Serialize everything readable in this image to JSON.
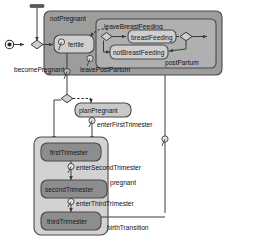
{
  "diagram": {
    "colors": {
      "outer_region_fill": "#9d9d9d",
      "inner_region_fill": "#b0b0b0",
      "pregnant_region_fill": "#d2d2d2",
      "state_fill_light": "#cfcfcf",
      "state_fill_dark": "#8d8d8d",
      "plan_state_fill": "#c9c9c9",
      "stroke": "#4a4a4a",
      "text": "#141414",
      "background": "#ffffff"
    },
    "regions": [
      {
        "id": "notPregnant",
        "label": "notPregnant"
      },
      {
        "id": "postPartum",
        "label": "postPartum"
      },
      {
        "id": "pregnant",
        "label": "pregnant"
      }
    ],
    "states": [
      {
        "id": "fertile",
        "label": "fertile"
      },
      {
        "id": "breastFeeding",
        "label": "breastFeeding"
      },
      {
        "id": "notBreastFeeding",
        "label": "notBreastFeeding"
      },
      {
        "id": "planPregnant",
        "label": "planPregnant"
      },
      {
        "id": "firstTrimester",
        "label": "firstTrimester"
      },
      {
        "id": "secondTrimester",
        "label": "secondTrimester"
      },
      {
        "id": "thirdTrimester",
        "label": "thirdTrimester"
      }
    ],
    "transitions": [
      {
        "id": "becomePregnant",
        "label": "becomePregnant"
      },
      {
        "id": "leaveBreastFeeding",
        "label": "leaveBreastFeeding"
      },
      {
        "id": "leavePostPartum",
        "label": "leavePostPartum"
      },
      {
        "id": "enterFirstTrimester",
        "label": "enterFirstTrimester"
      },
      {
        "id": "enterSecondTrimester",
        "label": "enterSecondTrimester"
      },
      {
        "id": "enterThirdTrimester",
        "label": "enterThirdTrimester"
      },
      {
        "id": "birthTransition",
        "label": "birthTransition"
      }
    ],
    "nodes": [
      {
        "id": "initial-node",
        "kind": "initial-state-icon"
      },
      {
        "id": "choice-entry",
        "kind": "choice-diamond-icon"
      },
      {
        "id": "choice-breastfeeding",
        "kind": "choice-diamond-icon"
      },
      {
        "id": "choice-postpartum-exit",
        "kind": "choice-diamond-icon"
      },
      {
        "id": "choice-plan",
        "kind": "choice-diamond-icon"
      },
      {
        "id": "top-bar",
        "kind": "entry-bar-icon"
      }
    ]
  }
}
